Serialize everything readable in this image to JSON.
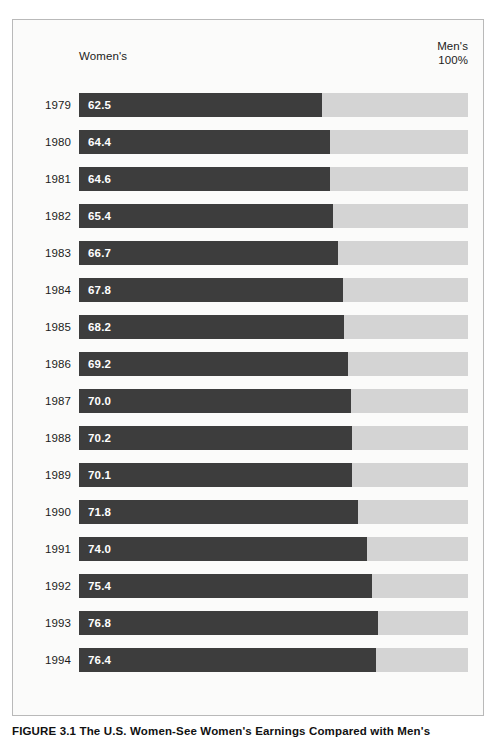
{
  "figure": {
    "caption_label": "FIGURE 3.1",
    "caption_text": "The U.S. Women-See Women's Earnings Compared with Men's"
  },
  "header": {
    "left_label": "Women's",
    "right_label_line1": "Men's",
    "right_label_line2": "100%"
  },
  "colors": {
    "bar_fill": "#3d3d3d",
    "bar_track": "#d4d4d4",
    "panel_background": "#fbfbfa",
    "panel_border": "#b9b9b9",
    "text": "#1b1b1b",
    "value_text": "#ffffff"
  },
  "chart_data": {
    "type": "bar",
    "title": "Women's Earnings Compared with Men's",
    "xlabel": "",
    "ylabel": "",
    "xlim": [
      0,
      100
    ],
    "grid": false,
    "legend": "none",
    "orientation": "horizontal",
    "stacked": true,
    "units": "percent of men's earnings",
    "reference_value": 100,
    "reference_label": "Men's 100%",
    "series_label": "Women's",
    "categories": [
      "1979",
      "1980",
      "1981",
      "1982",
      "1983",
      "1984",
      "1985",
      "1986",
      "1987",
      "1988",
      "1989",
      "1990",
      "1991",
      "1992",
      "1993",
      "1994"
    ],
    "values": [
      62.5,
      64.4,
      64.6,
      65.4,
      66.7,
      67.8,
      68.2,
      69.2,
      70.0,
      70.2,
      70.1,
      71.8,
      74.0,
      75.4,
      76.8,
      76.4
    ],
    "rows": [
      {
        "year": "1979",
        "value": 62.5,
        "label": "62.5"
      },
      {
        "year": "1980",
        "value": 64.4,
        "label": "64.4"
      },
      {
        "year": "1981",
        "value": 64.6,
        "label": "64.6"
      },
      {
        "year": "1982",
        "value": 65.4,
        "label": "65.4"
      },
      {
        "year": "1983",
        "value": 66.7,
        "label": "66.7"
      },
      {
        "year": "1984",
        "value": 67.8,
        "label": "67.8"
      },
      {
        "year": "1985",
        "value": 68.2,
        "label": "68.2"
      },
      {
        "year": "1986",
        "value": 69.2,
        "label": "69.2"
      },
      {
        "year": "1987",
        "value": 70.0,
        "label": "70.0"
      },
      {
        "year": "1988",
        "value": 70.2,
        "label": "70.2"
      },
      {
        "year": "1989",
        "value": 70.1,
        "label": "70.1"
      },
      {
        "year": "1990",
        "value": 71.8,
        "label": "71.8"
      },
      {
        "year": "1991",
        "value": 74.0,
        "label": "74.0"
      },
      {
        "year": "1992",
        "value": 75.4,
        "label": "75.4"
      },
      {
        "year": "1993",
        "value": 76.8,
        "label": "76.8"
      },
      {
        "year": "1994",
        "value": 76.4,
        "label": "76.4"
      }
    ]
  }
}
